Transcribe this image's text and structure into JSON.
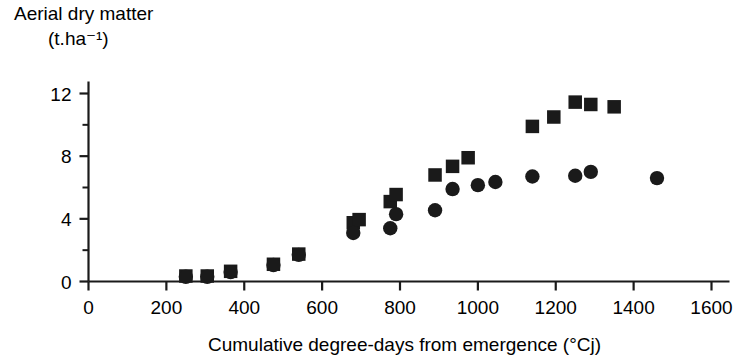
{
  "chart_data": {
    "type": "scatter",
    "title": "",
    "ylabel_line1": "Aerial dry matter",
    "ylabel_line2": "(t.ha⁻¹)",
    "xlabel": "Cumulative degree-days from emergence (°Cj)",
    "xlim": [
      0,
      1600
    ],
    "ylim": [
      0,
      13.2
    ],
    "xticks": [
      0,
      200,
      400,
      600,
      800,
      1000,
      1200,
      1400,
      1600
    ],
    "xtick_labels": [
      "0",
      "200",
      "400",
      "600",
      "800",
      "1000",
      "1200",
      "1400",
      "1600"
    ],
    "yticks": [
      0,
      4,
      8,
      12
    ],
    "ytick_labels": [
      "0",
      "4",
      "8",
      "12"
    ],
    "yticks_minor": [
      2,
      6,
      10
    ],
    "grid": false,
    "legend_position": "none",
    "marker_color": "#1a1a1a",
    "axis_color": "#1a1a1a",
    "series": [
      {
        "name": "squares",
        "marker": "square",
        "x": [
          250,
          305,
          365,
          475,
          540,
          680,
          695,
          775,
          790,
          890,
          935,
          975,
          1140,
          1195,
          1250,
          1290,
          1350
        ],
        "y": [
          0.35,
          0.35,
          0.65,
          1.1,
          1.75,
          3.75,
          3.95,
          5.1,
          5.55,
          6.8,
          7.35,
          7.9,
          9.9,
          10.5,
          11.45,
          11.3,
          11.15
        ]
      },
      {
        "name": "circles",
        "marker": "circle",
        "x": [
          250,
          305,
          365,
          475,
          540,
          680,
          775,
          790,
          890,
          935,
          1000,
          1045,
          1140,
          1250,
          1290,
          1460
        ],
        "y": [
          0.3,
          0.3,
          0.6,
          1.05,
          1.7,
          3.1,
          3.4,
          4.3,
          4.55,
          5.9,
          6.15,
          6.35,
          6.7,
          6.75,
          7.0,
          6.6
        ]
      }
    ]
  }
}
